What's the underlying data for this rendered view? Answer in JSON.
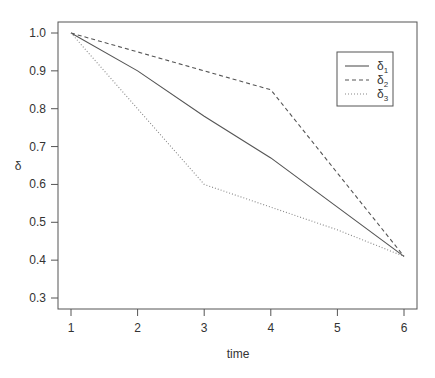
{
  "chart_data": {
    "type": "line",
    "title": "",
    "xlabel": "time",
    "ylabel": "δ",
    "x": [
      1,
      2,
      3,
      4,
      5,
      6
    ],
    "xticks": [
      "1",
      "2",
      "3",
      "4",
      "5",
      "6"
    ],
    "yticks": [
      "0.3",
      "0.4",
      "0.5",
      "0.6",
      "0.7",
      "0.8",
      "0.9",
      "1.0"
    ],
    "xlim": [
      1,
      6
    ],
    "ylim": [
      0.3,
      1.0
    ],
    "grid": false,
    "legend_position": "top-right",
    "series": [
      {
        "name": "δ1",
        "label_base": "δ",
        "label_sub": "1",
        "linestyle": "solid",
        "values": [
          1.0,
          0.9,
          0.78,
          0.67,
          0.54,
          0.41
        ]
      },
      {
        "name": "δ2",
        "label_base": "δ",
        "label_sub": "2",
        "linestyle": "dashed",
        "values": [
          1.0,
          0.95,
          0.9,
          0.85,
          0.63,
          0.41
        ]
      },
      {
        "name": "δ3",
        "label_base": "δ",
        "label_sub": "3",
        "linestyle": "dotted",
        "values": [
          1.0,
          0.8,
          0.6,
          0.54,
          0.48,
          0.41
        ]
      }
    ]
  }
}
